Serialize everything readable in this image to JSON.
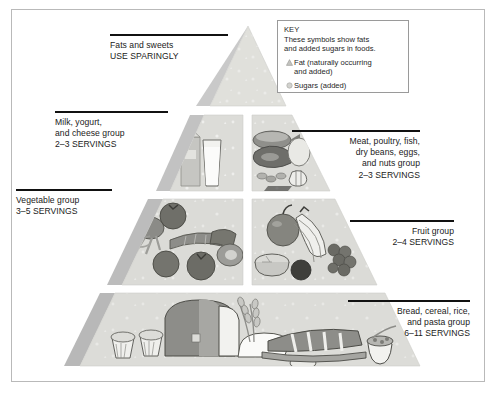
{
  "diagram": {
    "colors": {
      "tier_fill": "#d6d6d2",
      "tier_fill_light": "#e3e3df",
      "bevel": "#bdbdbd",
      "border": "#b9b9b9",
      "rule": "#111111",
      "text": "#1a1a1a",
      "background": "#ffffff"
    }
  },
  "key": {
    "title": "KEY",
    "description": "These symbols show fats\nand added sugars in foods.",
    "items": [
      {
        "symbol": "fat-triangle-icon",
        "label": "Fat (naturally occurring\n   and added)"
      },
      {
        "symbol": "sugar-circle-icon",
        "label": "Sugars (added)"
      }
    ]
  },
  "labels": {
    "fats": "Fats and sweets\nUSE SPARINGLY",
    "milk": "Milk, yogurt,\nand cheese group\n2–3 SERVINGS",
    "vegetable": "Vegetable group\n3–5 SERVINGS",
    "meat": "Meat, poultry, fish,\ndry beans, eggs,\nand nuts group\n2–3 SERVINGS",
    "fruit": "Fruit group\n2–4 SERVINGS",
    "bread": "Bread, cereal, rice,\nand pasta group\n6–11 SERVINGS"
  },
  "tiers": [
    {
      "name": "apex-fats-sweets",
      "foods": []
    },
    {
      "name": "milk-yogurt-cheese",
      "foods": [
        "milk-carton",
        "milk-glass"
      ]
    },
    {
      "name": "meat-poultry-fish",
      "foods": [
        "meat-cuts",
        "fish",
        "beans",
        "eggs",
        "nuts"
      ]
    },
    {
      "name": "vegetables",
      "foods": [
        "broccoli",
        "tomato",
        "corn",
        "pepper",
        "carrot"
      ]
    },
    {
      "name": "fruits",
      "foods": [
        "apple",
        "bananas",
        "grapes",
        "orange-half",
        "plum"
      ]
    },
    {
      "name": "bread-cereal-rice-pasta",
      "foods": [
        "muffins",
        "bread-loaf",
        "wheat-stalks",
        "baguette",
        "cereal-bowl"
      ]
    }
  ]
}
